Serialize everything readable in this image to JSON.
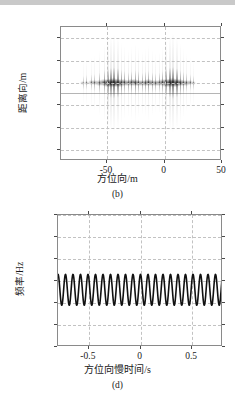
{
  "page": {
    "background": "#ffffff",
    "top_band_color": "#c9c9c9",
    "axis_color": "#8a8a8a",
    "grid_color": "#c2c2c2",
    "data_color": "#1a1a1a"
  },
  "figures": [
    {
      "id": "b",
      "caption": "(b)",
      "xlabel": "方位向/m",
      "ylabel": "距离向/m",
      "ytick_labels": [
        "4 460",
        "4 480",
        "4 500",
        "4 520",
        "4 540",
        "4 560"
      ],
      "xtick_labels": [
        "-50",
        "0",
        "50"
      ]
    },
    {
      "id": "d",
      "caption": "(d)",
      "xlabel": "方位向慢时间/s",
      "ylabel": "频率/Hz",
      "ytick_labels": [
        "300",
        "200",
        "100",
        "0",
        "-100",
        "-200",
        "-300"
      ],
      "xtick_labels": [
        "-0.5",
        "0",
        "0.5"
      ]
    }
  ],
  "chart_data": [
    {
      "type": "heatmap",
      "id": "b",
      "title": "",
      "caption": "(b)",
      "xlabel": "方位向/m",
      "ylabel": "距离向/m",
      "xlim": [
        -90,
        50
      ],
      "ylim": [
        4570,
        4450
      ],
      "y_inverted": true,
      "xticks": [
        -50,
        0,
        50
      ],
      "yticks": [
        4460,
        4480,
        4500,
        4520,
        4540,
        4560
      ],
      "xtick_labels": [
        "-50",
        "0",
        "50"
      ],
      "ytick_labels": [
        "4 460",
        "4 480",
        "4 500",
        "4 520",
        "4 540",
        "4 560"
      ],
      "grid": true,
      "colormap": "gray_inverted",
      "description": "SAR imaged point targets smeared along azimuth, all centered at range 4500 m",
      "target_range_m": 4500,
      "targets_azimuth_m": [
        -71,
        -68,
        -64,
        -61,
        -57,
        -53,
        -50,
        -47,
        -44,
        -41,
        -38,
        -35,
        -32,
        -29,
        -26,
        -23,
        -20,
        -17,
        -14,
        -11,
        -8,
        -5,
        -2,
        1,
        4,
        7,
        10,
        13,
        16,
        19,
        22,
        25
      ],
      "targets_intensity": [
        0.18,
        0.22,
        0.28,
        0.35,
        0.5,
        0.66,
        0.82,
        0.92,
        0.98,
        0.88,
        0.74,
        0.6,
        0.52,
        0.62,
        0.7,
        0.58,
        0.48,
        0.55,
        0.64,
        0.5,
        0.42,
        0.46,
        0.6,
        0.78,
        0.9,
        1.0,
        0.86,
        0.7,
        0.56,
        0.4,
        0.28,
        0.2
      ]
    },
    {
      "type": "line",
      "id": "d",
      "title": "",
      "caption": "(d)",
      "xlabel": "方位向慢时间/s",
      "ylabel": "频率/Hz",
      "xlim": [
        -0.8,
        0.8
      ],
      "ylim": [
        -300,
        300
      ],
      "xticks": [
        -0.5,
        0,
        0.5
      ],
      "yticks": [
        300,
        200,
        100,
        0,
        -100,
        -200,
        -300
      ],
      "xtick_labels": [
        "-0.5",
        "0",
        "0.5"
      ],
      "ytick_labels": [
        "300",
        "200",
        "100",
        "0",
        "-100",
        "-200",
        "-300"
      ],
      "grid": true,
      "series": [
        {
          "name": "instantaneous frequency",
          "color": "#111111",
          "waveform": "sinusoid",
          "cycles_over_xrange": 22,
          "offset_hz": -40,
          "amplitude_hz": 70,
          "peak_hz": 30,
          "trough_hz": -110,
          "phase_deg": 90
        }
      ]
    }
  ]
}
